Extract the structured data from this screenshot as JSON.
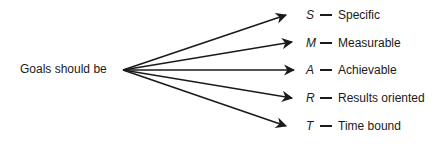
{
  "source": {
    "label": "Goals should be"
  },
  "items": [
    {
      "letter": "S",
      "word": "Specific"
    },
    {
      "letter": "M",
      "word": "Measurable"
    },
    {
      "letter": "A",
      "word": "Achievable"
    },
    {
      "letter": "R",
      "word": "Results oriented"
    },
    {
      "letter": "T",
      "word": "Time bound"
    }
  ]
}
